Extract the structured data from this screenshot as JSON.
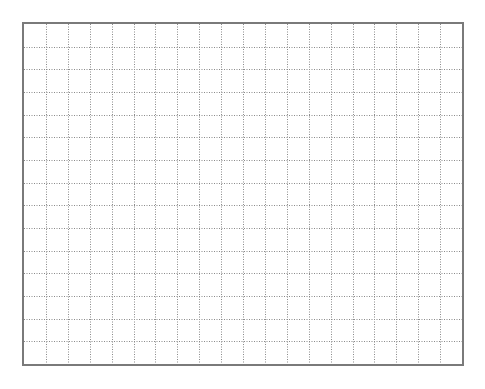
{
  "grid": {
    "columns": 20,
    "rows": 15,
    "line_color": "#8a8a8a",
    "border_color": "#7a7a7a",
    "background_color": "#ffffff",
    "line_style": "dotted"
  }
}
